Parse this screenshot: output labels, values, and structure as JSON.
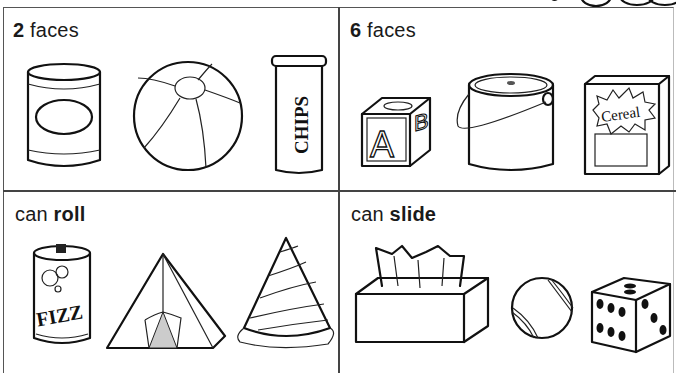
{
  "worksheet": {
    "cells": [
      {
        "number": "2",
        "rest": " faces",
        "items": [
          {
            "name": "soup-can"
          },
          {
            "name": "beach-ball"
          },
          {
            "name": "chips-tube",
            "text": "CHIPS"
          }
        ]
      },
      {
        "number": "6",
        "rest": " faces",
        "items": [
          {
            "name": "abc-block",
            "letters": [
              "A",
              "B",
              "C"
            ]
          },
          {
            "name": "paint-bucket"
          },
          {
            "name": "cereal-box",
            "text": "Cereal"
          }
        ]
      },
      {
        "prefix": "can ",
        "bold": "roll",
        "items": [
          {
            "name": "soda-can",
            "text": "FIZZ"
          },
          {
            "name": "tent"
          },
          {
            "name": "party-hat"
          }
        ]
      },
      {
        "prefix": "can ",
        "bold": "slide",
        "items": [
          {
            "name": "tissue-box"
          },
          {
            "name": "tennis-ball"
          },
          {
            "name": "die"
          }
        ]
      }
    ]
  }
}
